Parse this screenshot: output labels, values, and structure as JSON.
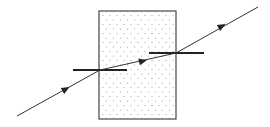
{
  "diagram": {
    "type": "refraction-through-glass-block",
    "background": "#ffffff",
    "block": {
      "x": 99,
      "y": 11,
      "width": 77,
      "height": 108,
      "stroke": "#555555",
      "fill": "#ffffff",
      "dot_color": "#9a9a9a",
      "dot_dx": 7,
      "dot_dy": 4.5
    },
    "ray": {
      "color": "#333333",
      "incident": {
        "x1": 17,
        "y1": 116,
        "x2": 100,
        "y2": 70
      },
      "refracted": {
        "x1": 100,
        "y1": 70,
        "x2": 176,
        "y2": 53
      },
      "emergent": {
        "x1": 176,
        "y1": 53,
        "x2": 258,
        "y2": 7
      }
    },
    "arrows": [
      {
        "x": 66,
        "y": 89,
        "segment": "incident"
      },
      {
        "x": 143,
        "y": 61,
        "segment": "refracted"
      },
      {
        "x": 222,
        "y": 26,
        "segment": "emergent"
      }
    ],
    "normals": [
      {
        "x1": 73,
        "x2": 127,
        "y": 70,
        "color": "#222222"
      },
      {
        "x1": 149,
        "x2": 204,
        "y": 53,
        "color": "#222222"
      }
    ]
  }
}
